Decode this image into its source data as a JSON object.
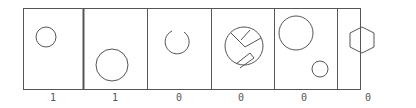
{
  "panels": [
    {
      "id": 1,
      "label": "1",
      "shape": "small-circle-upper-left"
    },
    {
      "id": 2,
      "label": "1",
      "shape": "large-circle-lower-center"
    },
    {
      "id": 3,
      "label": "0",
      "shape": "open-circle-arc"
    },
    {
      "id": 4,
      "label": "0",
      "shape": "circle-with-bent-lines"
    },
    {
      "id": 5,
      "label": "0",
      "shape": "two-circles"
    },
    {
      "id": 6,
      "label": "0",
      "shape": "hexagon"
    }
  ],
  "colors": {
    "stroke": "#555555",
    "background": "#ffffff"
  }
}
